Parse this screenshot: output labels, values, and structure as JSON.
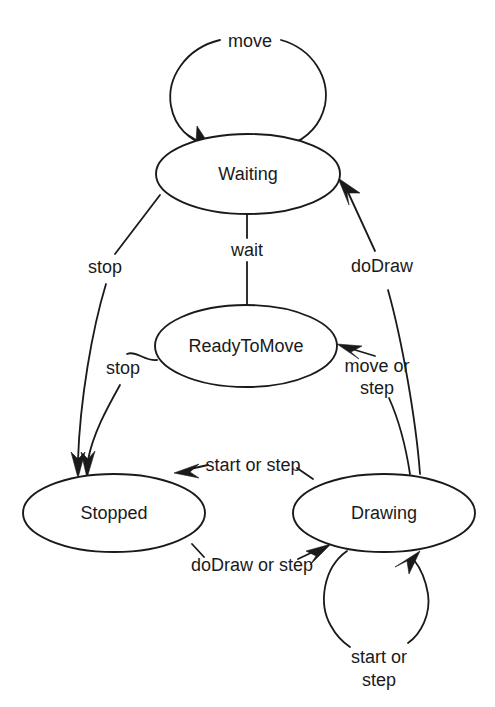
{
  "diagram": {
    "type": "state-machine-diagram",
    "background_color": "#ffffff",
    "stroke_color": "#1a1a1a",
    "states": [
      {
        "id": "waiting",
        "label": "Waiting",
        "cx": 248,
        "cy": 174,
        "rx": 92,
        "ry": 40
      },
      {
        "id": "readytomove",
        "label": "ReadyToMove",
        "cx": 246,
        "cy": 346,
        "rx": 91,
        "ry": 41
      },
      {
        "id": "stopped",
        "label": "Stopped",
        "cx": 114,
        "cy": 513,
        "rx": 91,
        "ry": 39
      },
      {
        "id": "drawing",
        "label": "Drawing",
        "cx": 384,
        "cy": 513,
        "rx": 91,
        "ry": 39
      }
    ],
    "transitions": [
      {
        "id": "t-move",
        "label": "move",
        "from": "waiting",
        "to": "waiting",
        "kind": "self-loop"
      },
      {
        "id": "t-wait",
        "label": "wait",
        "from": "waiting",
        "to": "readytomove",
        "kind": "straight"
      },
      {
        "id": "t-stop-waiting",
        "label": "stop",
        "from": "waiting",
        "to": "stopped",
        "kind": "curve"
      },
      {
        "id": "t-stop-ready",
        "label": "stop",
        "from": "readytomove",
        "to": "stopped",
        "kind": "curve"
      },
      {
        "id": "t-dodraw",
        "label": "doDraw",
        "from": "drawing",
        "to": "waiting",
        "kind": "curve"
      },
      {
        "id": "t-move-or-step",
        "label": "move or\nstep",
        "label_line1": "move or",
        "label_line2": "step",
        "from": "drawing",
        "to": "readytomove",
        "kind": "curve"
      },
      {
        "id": "t-start-or-step",
        "label": "start or step",
        "from": "drawing",
        "to": "stopped",
        "kind": "curve"
      },
      {
        "id": "t-dodraw-or-step",
        "label": "doDraw or step",
        "from": "stopped",
        "to": "drawing",
        "kind": "curve"
      },
      {
        "id": "t-drawing-self",
        "label": "start or\nstep",
        "label_line1": "start or",
        "label_line2": "step",
        "from": "drawing",
        "to": "drawing",
        "kind": "self-loop"
      }
    ],
    "labels": {
      "move": "move",
      "wait": "wait",
      "stop_from_waiting": "stop",
      "stop_from_ready": "stop",
      "dodraw": "doDraw",
      "move_or_step_line1": "move or",
      "move_or_step_line2": "step",
      "start_or_step": "start or step",
      "dodraw_or_step": "doDraw or step",
      "drawing_self_line1": "start or",
      "drawing_self_line2": "step"
    }
  }
}
